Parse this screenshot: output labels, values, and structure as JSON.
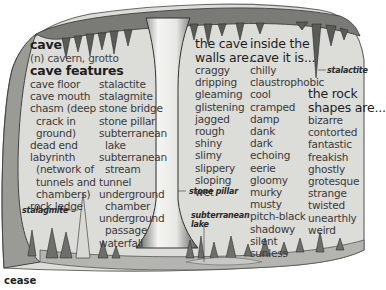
{
  "title": "cave",
  "definition": "(n) cavern, grotto",
  "features": {
    "heading": "cave features",
    "col1": [
      "cave floor",
      "cave mouth",
      "chasm (deep",
      "crack in",
      "ground)",
      "dead end",
      "labyrinth",
      "(network of",
      "tunnels and",
      "chambers)",
      "rock ledge"
    ],
    "col2": [
      "stalactite",
      "stalagmite",
      "stone bridge",
      "stone pillar",
      "subterranean",
      "lake",
      "subterranean",
      "stream",
      "tunnel",
      "underground",
      "chamber",
      "underground",
      "passage",
      "waterfall"
    ]
  },
  "walls": {
    "heading_line1": "the cave",
    "heading_line2": "walls are...",
    "items": [
      "craggy",
      "dripping",
      "gleaming",
      "glistening",
      "jagged",
      "rough",
      "shiny",
      "slimy",
      "slippery",
      "sloping",
      "wet"
    ]
  },
  "inside": {
    "heading_line1": "inside the",
    "heading_line2": "cave it is...",
    "items": [
      "chilly",
      "claustrophobic",
      "cool",
      "cramped",
      "damp",
      "dank",
      "dark",
      "echoing",
      "eerie",
      "gloomy",
      "murky",
      "musty",
      "pitch-black",
      "shadowy",
      "silent",
      "sunless"
    ]
  },
  "rocks": {
    "heading_line1": "the rock",
    "heading_line2": "shapes are...",
    "items": [
      "bizarre",
      "contorted",
      "fantastic",
      "freakish",
      "ghostly",
      "grotesque",
      "strange",
      "twisted",
      "unearthly",
      "weird"
    ]
  },
  "labels": {
    "stalactite": "stalactite",
    "stalagmite": "stalagmite",
    "stone_pillar": "stone pillar",
    "lake_line1": "subterranean",
    "lake_line2": "lake"
  },
  "footer": "cease",
  "colors": {
    "cave_bg": "#dcdcd8",
    "rock_dark": "#4a4a4a",
    "rock_mid": "#8a8a86",
    "text": "#3a3a3a"
  }
}
